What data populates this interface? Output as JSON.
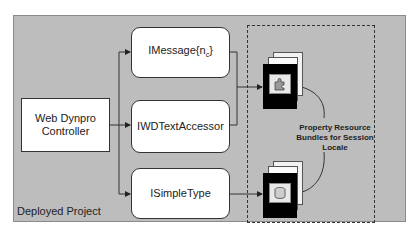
{
  "diagram": {
    "container_label": "Deployed Project",
    "controller": {
      "label_line1": "Web Dynpro",
      "label_line2": "Controller"
    },
    "interfaces": [
      {
        "label": "IMessage{n",
        "subscript": "c",
        "suffix": "}"
      },
      {
        "label": "IWDTextAccessor"
      },
      {
        "label": "ISimpleType"
      }
    ],
    "resource_bundles": {
      "label_line1": "Property Resource",
      "label_line2": "Bundles for Session",
      "label_line3": "Locale",
      "icons": [
        "puzzle-document-icon",
        "database-document-icon"
      ]
    },
    "colors": {
      "container_bg": "#bdbdbd",
      "box_bg": "#ffffff",
      "line": "#333333",
      "doc_front": "#000000"
    }
  }
}
